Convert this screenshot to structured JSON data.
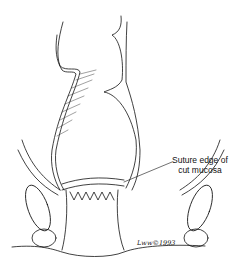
{
  "figure": {
    "annotation": {
      "line1": "Suture edge of",
      "line2": "cut mucosa"
    },
    "signature": "Lww©1993"
  }
}
